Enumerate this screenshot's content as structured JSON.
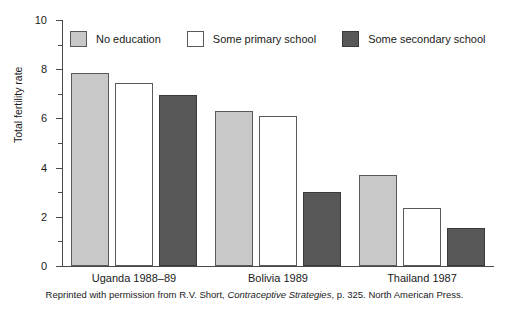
{
  "figure": {
    "caption_before": "Reprinted with permission from R.V. Short, ",
    "caption_italic": "Contraceptive Strategies",
    "caption_after": ", p. 325. North American Press."
  },
  "chart_data": {
    "type": "bar",
    "title": "",
    "xlabel": "",
    "ylabel": "Total fertility rate",
    "ylim": [
      0,
      10
    ],
    "yticks": [
      0,
      2,
      4,
      6,
      8,
      10
    ],
    "ytick_labels": [
      "0",
      "2",
      "4",
      "6",
      "8",
      "10"
    ],
    "yminor_ticks": [
      1,
      3,
      5,
      7,
      9
    ],
    "grid": false,
    "legend_position": "top-left-inside",
    "categories": [
      "Uganda 1988–89",
      "Bolivia 1989",
      "Thailand 1987"
    ],
    "series": [
      {
        "name": "No education",
        "color": "#c8c8c8",
        "values": [
          7.85,
          6.3,
          3.7
        ]
      },
      {
        "name": "Some primary school",
        "color": "#ffffff",
        "values": [
          7.45,
          6.1,
          2.35
        ]
      },
      {
        "name": "Some secondary school",
        "color": "#585858",
        "values": [
          6.95,
          3.0,
          1.55
        ]
      }
    ]
  }
}
